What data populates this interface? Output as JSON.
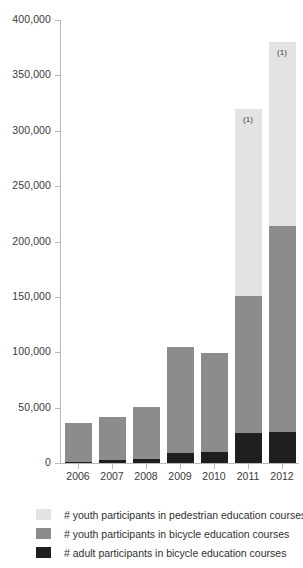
{
  "chart_data": {
    "type": "bar",
    "stacked": true,
    "title": "",
    "subtitle": "",
    "xlabel": "",
    "ylabel": "",
    "categories": [
      "2006",
      "2007",
      "2008",
      "2009",
      "2010",
      "2011",
      "2012"
    ],
    "series": [
      {
        "name": "# adult participants in bicycle education courses",
        "color": "#1f1f1f",
        "values": [
          1000,
          2500,
          4000,
          9000,
          10000,
          27000,
          28000
        ]
      },
      {
        "name": "# youth participants in bicycle education courses",
        "color": "#8c8c8c",
        "values": [
          35000,
          39500,
          47000,
          96000,
          89000,
          124000,
          186000
        ]
      },
      {
        "name": "# youth participants in pedestrian education courses",
        "color": "#e3e3e3",
        "values": [
          0,
          0,
          0,
          0,
          0,
          169000,
          166000
        ]
      }
    ],
    "totals": [
      36000,
      42000,
      51000,
      105000,
      99000,
      320000,
      380000
    ],
    "annotations": [
      {
        "category": "2011",
        "text": "(1)"
      },
      {
        "category": "2012",
        "text": "(1)"
      }
    ],
    "ylim": [
      0,
      400000
    ],
    "yticks": [
      0,
      50000,
      100000,
      150000,
      200000,
      250000,
      300000,
      350000,
      400000
    ],
    "ytick_labels": [
      "0",
      "50,000",
      "100,000",
      "150,000",
      "200,000",
      "250,000",
      "300,000",
      "350,000",
      "400,000"
    ],
    "grid": false,
    "legend_position": "bottom-left"
  },
  "legend": {
    "items": [
      {
        "label": "# youth participants in pedestrian education courses",
        "color": "#e3e3e3"
      },
      {
        "label": "# youth participants in bicycle education courses",
        "color": "#8c8c8c"
      },
      {
        "label": "# adult participants in bicycle education courses",
        "color": "#1f1f1f"
      }
    ]
  }
}
